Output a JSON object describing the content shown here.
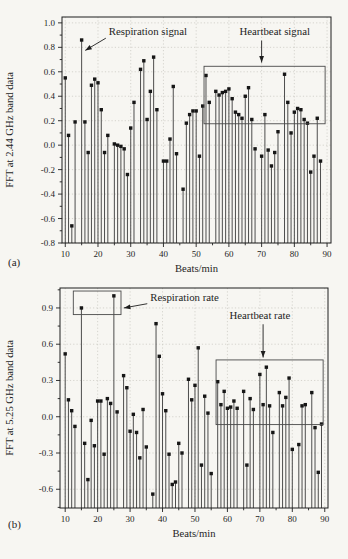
{
  "page": {
    "background": "#f7f6f2"
  },
  "style": {
    "fg": "#1e1e1e",
    "stem_color": "#3a3a3a",
    "marker_color": "#161616",
    "grid_color": "#c7c5bf",
    "box_color": "#4a4a4a"
  },
  "chart_data": [
    {
      "id": "a",
      "type": "stem",
      "marker": "square",
      "panel_label": "(a)",
      "xlabel": "Beats/min",
      "ylabel": "FFT at 2.44 GHz band data",
      "grid": true,
      "legend": null,
      "xlim": [
        9,
        91.2
      ],
      "ylim": [
        -0.8,
        1.048
      ],
      "xticks": [
        10,
        20,
        30,
        40,
        50,
        60,
        70,
        80,
        90
      ],
      "xtick_labels": [
        "10",
        "20",
        "30",
        "40",
        "50",
        "60",
        "70",
        "80",
        "90"
      ],
      "yticks": [
        1.0,
        0.8,
        0.6,
        0.4,
        0.2,
        0.0,
        -0.2,
        -0.4,
        -0.6,
        -0.8
      ],
      "ytick_labels": [
        "1.0",
        "0.8",
        "0.6",
        "0.4",
        "0.2",
        "0.0",
        "-0.2",
        "-0.4",
        "-0.6",
        "-0.8"
      ],
      "minor_x_step": 5,
      "minor_y_step": 0.1,
      "points": [
        [
          10,
          0.55
        ],
        [
          11,
          0.08
        ],
        [
          12,
          -0.66
        ],
        [
          13,
          0.19
        ],
        [
          15,
          0.86
        ],
        [
          16,
          0.19
        ],
        [
          17,
          -0.06
        ],
        [
          18,
          0.49
        ],
        [
          19,
          0.54
        ],
        [
          20,
          0.51
        ],
        [
          21,
          0.29
        ],
        [
          22,
          -0.06
        ],
        [
          23,
          0.08
        ],
        [
          25,
          0.01
        ],
        [
          26,
          0.0
        ],
        [
          27,
          -0.01
        ],
        [
          28,
          -0.03
        ],
        [
          29,
          -0.24
        ],
        [
          30,
          0.14
        ],
        [
          31,
          0.35
        ],
        [
          33,
          0.62
        ],
        [
          34,
          0.69
        ],
        [
          35,
          0.21
        ],
        [
          36,
          0.44
        ],
        [
          37,
          0.72
        ],
        [
          38,
          0.29
        ],
        [
          40,
          -0.13
        ],
        [
          41,
          -0.13
        ],
        [
          42,
          0.05
        ],
        [
          43,
          0.48
        ],
        [
          44,
          -0.07
        ],
        [
          46,
          -0.36
        ],
        [
          47,
          0.18
        ],
        [
          48,
          0.25
        ],
        [
          49,
          0.28
        ],
        [
          50,
          0.28
        ],
        [
          51,
          -0.09
        ],
        [
          52,
          0.32
        ],
        [
          53,
          0.57
        ],
        [
          54,
          0.35
        ],
        [
          56,
          0.44
        ],
        [
          57,
          0.41
        ],
        [
          58,
          0.43
        ],
        [
          59,
          0.44
        ],
        [
          60,
          0.46
        ],
        [
          61,
          0.38
        ],
        [
          62,
          0.27
        ],
        [
          63,
          0.25
        ],
        [
          64,
          0.22
        ],
        [
          65,
          0.4
        ],
        [
          66,
          0.47
        ],
        [
          67,
          0.21
        ],
        [
          68,
          -0.03
        ],
        [
          70,
          -0.09
        ],
        [
          71,
          0.25
        ],
        [
          72,
          -0.04
        ],
        [
          73,
          -0.17
        ],
        [
          74,
          -0.06
        ],
        [
          75,
          0.11
        ],
        [
          77,
          0.58
        ],
        [
          78,
          0.35
        ],
        [
          79,
          0.1
        ],
        [
          80,
          0.27
        ],
        [
          81,
          0.3
        ],
        [
          82,
          0.29
        ],
        [
          83,
          0.21
        ],
        [
          84,
          0.18
        ],
        [
          85,
          -0.22
        ],
        [
          86,
          -0.09
        ],
        [
          87,
          0.22
        ],
        [
          88,
          -0.13
        ]
      ],
      "boxes": [
        {
          "name": "heartbeat-signal-region",
          "x0": 52.4,
          "x1": 89.4,
          "y0": 0.175,
          "y1": 0.645
        }
      ],
      "annotations": [
        {
          "name": "respiration-signal",
          "text": "Respiration signal",
          "tx": 23.3,
          "ty": 0.9,
          "anchor": "start",
          "arrow": {
            "x0": 22.4,
            "y0": 0.875,
            "x1": 16.1,
            "y1": 0.775
          }
        },
        {
          "name": "heartbeat-signal",
          "text": "Heartbeat signal",
          "tx": 74,
          "ty": 0.9,
          "anchor": "middle",
          "arrow": {
            "x0": 70,
            "y0": 0.855,
            "x1": 70,
            "y1": 0.675
          }
        }
      ]
    },
    {
      "id": "b",
      "type": "stem",
      "marker": "square",
      "panel_label": "(b)",
      "xlabel": "Beats/min",
      "ylabel": "FFT at 5.25 GHz band data",
      "grid": true,
      "legend": null,
      "xlim": [
        8.4,
        91
      ],
      "ylim": [
        -0.755,
        1.065
      ],
      "xticks": [
        10,
        20,
        30,
        40,
        50,
        60,
        70,
        80,
        90
      ],
      "xtick_labels": [
        "10",
        "20",
        "30",
        "40",
        "50",
        "60",
        "70",
        "80",
        "90"
      ],
      "yticks": [
        0.9,
        0.6,
        0.3,
        0.0,
        -0.3,
        -0.6
      ],
      "ytick_labels": [
        "0.9",
        "0.6",
        "0.3",
        "0.0",
        "-0.3",
        "-0.6"
      ],
      "minor_x_step": 5,
      "minor_y_step": 0.15,
      "points": [
        [
          10,
          0.52
        ],
        [
          11,
          0.14
        ],
        [
          12,
          0.05
        ],
        [
          13,
          -0.08
        ],
        [
          15,
          0.9
        ],
        [
          16,
          -0.22
        ],
        [
          17,
          -0.52
        ],
        [
          18,
          -0.03
        ],
        [
          19,
          -0.24
        ],
        [
          20,
          0.13
        ],
        [
          21,
          0.13
        ],
        [
          22,
          -0.31
        ],
        [
          23,
          0.15
        ],
        [
          24,
          0.11
        ],
        [
          25,
          1.0
        ],
        [
          26,
          0.04
        ],
        [
          28,
          0.34
        ],
        [
          29,
          0.24
        ],
        [
          30,
          -0.12
        ],
        [
          31,
          0.02
        ],
        [
          32,
          -0.13
        ],
        [
          33,
          -0.34
        ],
        [
          34,
          0.06
        ],
        [
          35,
          -0.25
        ],
        [
          37,
          -0.64
        ],
        [
          38,
          0.77
        ],
        [
          39,
          0.5
        ],
        [
          40,
          0.19
        ],
        [
          41,
          0.05
        ],
        [
          42,
          -0.31
        ],
        [
          43,
          -0.56
        ],
        [
          44,
          -0.54
        ],
        [
          45,
          -0.22
        ],
        [
          46,
          -0.3
        ],
        [
          48,
          0.31
        ],
        [
          49,
          0.14
        ],
        [
          50,
          0.26
        ],
        [
          51,
          0.57
        ],
        [
          52,
          -0.4
        ],
        [
          53,
          0.17
        ],
        [
          54,
          0.03
        ],
        [
          55,
          -0.47
        ],
        [
          57,
          0.29
        ],
        [
          58,
          0.1
        ],
        [
          59,
          0.21
        ],
        [
          60,
          0.07
        ],
        [
          61,
          0.08
        ],
        [
          62,
          0.13
        ],
        [
          63,
          0.07
        ],
        [
          65,
          0.21
        ],
        [
          66,
          -0.4
        ],
        [
          67,
          0.15
        ],
        [
          68,
          0.06
        ],
        [
          70,
          0.35
        ],
        [
          71,
          0.1
        ],
        [
          72,
          0.41
        ],
        [
          73,
          0.09
        ],
        [
          74,
          -0.13
        ],
        [
          76,
          0.2
        ],
        [
          77,
          0.09
        ],
        [
          78,
          0.16
        ],
        [
          79,
          0.32
        ],
        [
          80,
          -0.27
        ],
        [
          82,
          -0.23
        ],
        [
          83,
          0.09
        ],
        [
          84,
          0.1
        ],
        [
          86,
          0.2
        ],
        [
          87,
          -0.09
        ],
        [
          88,
          -0.46
        ],
        [
          89,
          -0.06
        ]
      ],
      "boxes": [
        {
          "name": "respiration-rate-region",
          "x0": 12.5,
          "x1": 27.2,
          "y0": 0.845,
          "y1": 1.04
        },
        {
          "name": "heartbeat-rate-region",
          "x0": 56.5,
          "x1": 89.5,
          "y0": -0.065,
          "y1": 0.47
        }
      ],
      "annotations": [
        {
          "name": "respiration-rate",
          "text": "Respiration rate",
          "tx": 36.2,
          "ty": 0.955,
          "anchor": "start",
          "arrow": {
            "x0": 35.3,
            "y0": 0.935,
            "x1": 28.1,
            "y1": 0.9
          }
        },
        {
          "name": "heartbeat-rate",
          "text": "Heartbeat rate",
          "tx": 70,
          "ty": 0.81,
          "anchor": "middle",
          "arrow": {
            "x0": 71,
            "y0": 0.765,
            "x1": 71,
            "y1": 0.49
          }
        }
      ]
    }
  ]
}
